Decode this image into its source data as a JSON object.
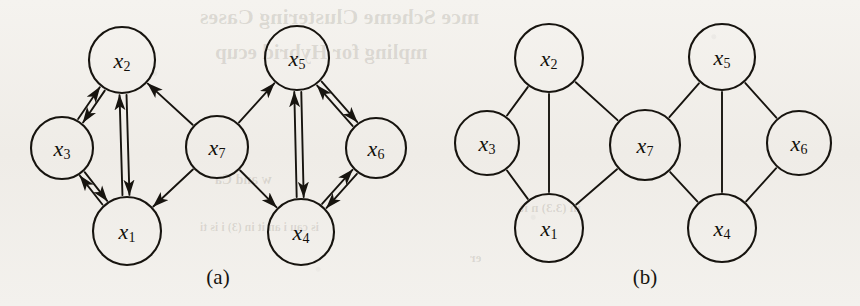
{
  "figure": {
    "background_color": "#f2f0ec",
    "ink_color": "#17140f",
    "panels": [
      {
        "id": "a",
        "caption": "(a)",
        "caption_x": 218,
        "caption_y": 284,
        "graph_type": "directed",
        "nodes": [
          {
            "id": "x2",
            "base": "x",
            "sub": "2",
            "label": "x2",
            "cx": 122,
            "cy": 60,
            "r": 33
          },
          {
            "id": "x3",
            "base": "x",
            "sub": "3",
            "label": "x3",
            "cx": 62,
            "cy": 148,
            "r": 31
          },
          {
            "id": "x1",
            "base": "x",
            "sub": "1",
            "label": "x1",
            "cx": 127,
            "cy": 231,
            "r": 34
          },
          {
            "id": "x7",
            "base": "x",
            "sub": "7",
            "label": "x7",
            "cx": 217,
            "cy": 147,
            "r": 31
          },
          {
            "id": "x5",
            "base": "x",
            "sub": "5",
            "label": "x5",
            "cx": 297,
            "cy": 58,
            "r": 32
          },
          {
            "id": "x6",
            "base": "x",
            "sub": "6",
            "label": "x6",
            "cx": 376,
            "cy": 148,
            "r": 30
          },
          {
            "id": "x4",
            "base": "x",
            "sub": "4",
            "label": "x4",
            "cx": 301,
            "cy": 232,
            "r": 33
          }
        ],
        "edges": [
          {
            "from": "x2",
            "to": "x3",
            "kind": "bidirectional",
            "offset": 6
          },
          {
            "from": "x2",
            "to": "x1",
            "kind": "bidirectional",
            "offset": 7
          },
          {
            "from": "x3",
            "to": "x1",
            "kind": "bidirectional",
            "offset": 6
          },
          {
            "from": "x7",
            "to": "x2",
            "kind": "directed",
            "offset": 0
          },
          {
            "from": "x7",
            "to": "x1",
            "kind": "directed",
            "offset": 0
          },
          {
            "from": "x7",
            "to": "x5",
            "kind": "directed",
            "offset": 0
          },
          {
            "from": "x7",
            "to": "x4",
            "kind": "directed",
            "offset": 0
          },
          {
            "from": "x5",
            "to": "x6",
            "kind": "bidirectional",
            "offset": 6
          },
          {
            "from": "x5",
            "to": "x4",
            "kind": "bidirectional",
            "offset": 7
          },
          {
            "from": "x4",
            "to": "x6",
            "kind": "bidirectional",
            "offset": 6
          }
        ]
      },
      {
        "id": "b",
        "caption": "(b)",
        "caption_x": 645,
        "caption_y": 284,
        "graph_type": "undirected",
        "nodes": [
          {
            "id": "x2",
            "base": "x",
            "sub": "2",
            "label": "x2",
            "cx": 549,
            "cy": 58,
            "r": 34
          },
          {
            "id": "x3",
            "base": "x",
            "sub": "3",
            "label": "x3",
            "cx": 487,
            "cy": 143,
            "r": 32
          },
          {
            "id": "x1",
            "base": "x",
            "sub": "1",
            "label": "x1",
            "cx": 549,
            "cy": 228,
            "r": 34
          },
          {
            "id": "x7",
            "base": "x",
            "sub": "7",
            "label": "x7",
            "cx": 645,
            "cy": 145,
            "r": 35
          },
          {
            "id": "x5",
            "base": "x",
            "sub": "5",
            "label": "x5",
            "cx": 722,
            "cy": 57,
            "r": 33
          },
          {
            "id": "x6",
            "base": "x",
            "sub": "6",
            "label": "x6",
            "cx": 799,
            "cy": 143,
            "r": 32
          },
          {
            "id": "x4",
            "base": "x",
            "sub": "4",
            "label": "x4",
            "cx": 722,
            "cy": 228,
            "r": 34
          }
        ],
        "edges": [
          {
            "from": "x2",
            "to": "x3",
            "kind": "plain",
            "offset": 0
          },
          {
            "from": "x2",
            "to": "x1",
            "kind": "plain",
            "offset": 0
          },
          {
            "from": "x2",
            "to": "x7",
            "kind": "plain",
            "offset": 0
          },
          {
            "from": "x3",
            "to": "x1",
            "kind": "plain",
            "offset": 0
          },
          {
            "from": "x1",
            "to": "x7",
            "kind": "plain",
            "offset": 0
          },
          {
            "from": "x7",
            "to": "x5",
            "kind": "plain",
            "offset": 0
          },
          {
            "from": "x7",
            "to": "x4",
            "kind": "plain",
            "offset": 0
          },
          {
            "from": "x5",
            "to": "x4",
            "kind": "plain",
            "offset": 0
          },
          {
            "from": "x5",
            "to": "x6",
            "kind": "plain",
            "offset": 0
          },
          {
            "from": "x4",
            "to": "x6",
            "kind": "plain",
            "offset": 0
          }
        ]
      }
    ],
    "bleed_through_text": [
      {
        "text": "mce Scheme Clustering  Cases",
        "x": 200,
        "y": 4,
        "size": 22
      },
      {
        "text": "mpling  for  Hybrid  ecup",
        "x": 215,
        "y": 40,
        "size": 21
      },
      {
        "text": "w and Ca",
        "x": 215,
        "y": 172,
        "size": 14
      },
      {
        "text": "is  cau    i  an it  in (3)    i  is  ti",
        "x": 200,
        "y": 220,
        "size": 12
      },
      {
        "text": "  in (3.3)  n  it",
        "x": 520,
        "y": 200,
        "size": 13
      },
      {
        "text": "er",
        "x": 470,
        "y": 250,
        "size": 13
      }
    ]
  }
}
